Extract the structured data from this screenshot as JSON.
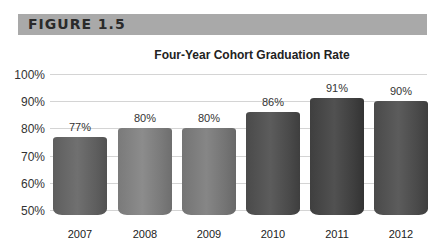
{
  "figure": {
    "label": "FIGURE 1.5"
  },
  "chart_data": {
    "type": "bar",
    "title": "Four-Year Cohort Graduation Rate",
    "xlabel": "",
    "ylabel": "",
    "categories": [
      "2007",
      "2008",
      "2009",
      "2010",
      "2011",
      "2012"
    ],
    "values": [
      77,
      80,
      80,
      86,
      91,
      90
    ],
    "value_labels": [
      "77%",
      "80%",
      "80%",
      "86%",
      "91%",
      "90%"
    ],
    "ylim": [
      50,
      100
    ],
    "yticks": [
      "100%",
      "90%",
      "80%",
      "70%",
      "60%",
      "50%"
    ],
    "grid": true,
    "legend": null,
    "bar_colors": [
      "#5e5e5e",
      "#7a7a7a",
      "#747474",
      "#4a4a4a",
      "#3f3f3f",
      "#4a4a4a"
    ]
  }
}
